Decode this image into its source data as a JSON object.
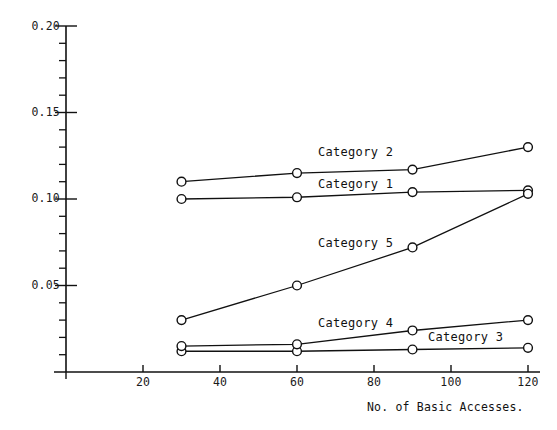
{
  "chart_data": {
    "type": "line",
    "title": "",
    "subtitle": "",
    "xlabel": "No. of Basic Accesses.",
    "ylabel": "",
    "x": [
      30,
      60,
      90,
      120
    ],
    "xlim": [
      0,
      127
    ],
    "ylim": [
      0,
      0.2
    ],
    "x_ticks": [
      20,
      40,
      60,
      80,
      100,
      120
    ],
    "x_tick_labels": [
      "20",
      "40",
      "60",
      "80",
      "100",
      "120"
    ],
    "y_ticks": [
      0.05,
      0.1,
      0.15,
      0.2
    ],
    "y_tick_labels": [
      "0.05",
      "0.10",
      "0.15",
      "0.20"
    ],
    "y_minor_tick_step": 0.01,
    "grid": false,
    "legend_position": "inline-labels",
    "marker": "open-circle",
    "series": [
      {
        "name": "Category 1",
        "label": "Category 1",
        "values": [
          0.1,
          0.101,
          0.104,
          0.105
        ],
        "label_x": 60,
        "label_y": 0.108
      },
      {
        "name": "Category 2",
        "label": "Category 2",
        "values": [
          0.11,
          0.115,
          0.117,
          0.13
        ],
        "label_x": 60,
        "label_y": 0.126
      },
      {
        "name": "Category 3",
        "label": "Category 3",
        "values": [
          0.012,
          0.012,
          0.013,
          0.014
        ],
        "label_x": 90,
        "label_y": 0.02
      },
      {
        "name": "Category 4",
        "label": "Category 4",
        "values": [
          0.015,
          0.016,
          0.024,
          0.03
        ],
        "label_x": 60,
        "label_y": 0.028
      },
      {
        "name": "Category 5",
        "label": "Category 5",
        "values": [
          0.03,
          0.05,
          0.072,
          0.103
        ],
        "label_x": 60,
        "label_y": 0.074
      }
    ],
    "colors": {
      "axis": "#111111",
      "line": "#111111",
      "marker_fill": "#ffffff",
      "marker_stroke": "#111111",
      "background": "#ffffff",
      "text": "#111111"
    }
  },
  "y_axis": {
    "labels": [
      "0.20",
      "0.15",
      "0.10",
      "0.05"
    ]
  },
  "x_axis": {
    "labels": [
      "20",
      "40",
      "60",
      "80",
      "100",
      "120"
    ],
    "caption": "No. of Basic Accesses."
  }
}
